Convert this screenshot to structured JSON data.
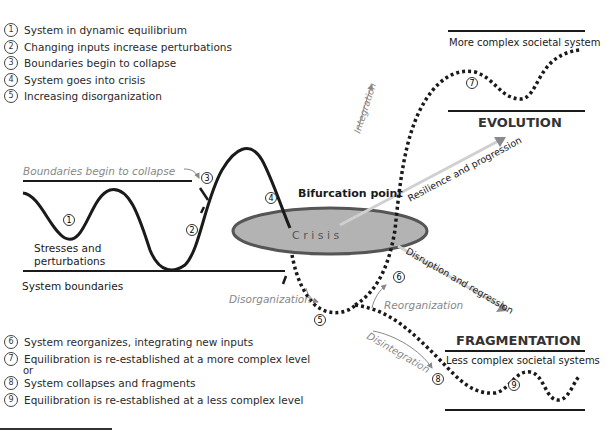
{
  "legend_top": [
    {
      "num": "1",
      "text": "System in dynamic equilibrium"
    },
    {
      "num": "2",
      "text": "Changing inputs increase perturbations"
    },
    {
      "num": "3",
      "text": "Boundaries begin to collapse"
    },
    {
      "num": "4",
      "text": "System goes into crisis"
    },
    {
      "num": "5",
      "text": "Increasing disorganization"
    }
  ],
  "legend_bottom": [
    {
      "num": "6",
      "text": "System reorganizes, integrating new inputs"
    },
    {
      "num": "7",
      "text": "Equilibration is re-established at a more complex level"
    },
    {
      "num": "8",
      "text": "System collapses and fragments"
    },
    {
      "num": "9",
      "text": "Equilibration is re-established at a less complex level"
    }
  ],
  "legend_or": "or",
  "labels": {
    "boundaries_collapse": "Boundaries begin to collapse",
    "stresses_line1": "Stresses and",
    "stresses_line2": "perturbations",
    "system_boundaries": "System boundaries",
    "bifurcation_point": "Bifurcation point",
    "crisis": "C r i s i s",
    "integration": "Integration",
    "resilience": "Resilience and progression",
    "disruption": "Disruption and regression",
    "disorganization": "Disorganization",
    "reorganization": "Reorganization",
    "disintegration": "Disintegration",
    "more_complex": "More complex societal system",
    "evolution": "EVOLUTION",
    "fragmentation": "FRAGMENTATION",
    "less_complex": "Less complex societal systems"
  },
  "markers": {
    "m1": "1",
    "m2": "2",
    "m3": "3",
    "m4": "4",
    "m5": "5",
    "m6": "6",
    "m7": "7",
    "m8": "8",
    "m9": "9"
  },
  "colors": {
    "ink": "#1a1a1a",
    "ellipse_fill": "#b3b3b3",
    "ellipse_stroke": "#555555",
    "arrow_gray": "#c8c8c8",
    "label_gray": "#8a8a8a"
  }
}
